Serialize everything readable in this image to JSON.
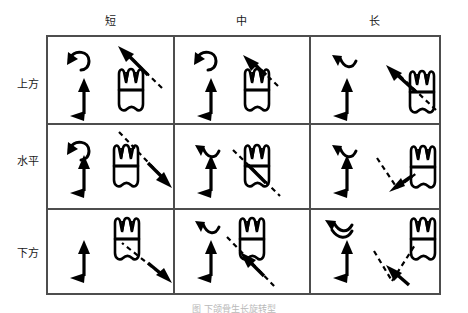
{
  "figure": {
    "title_caption": "图 下颌骨生长旋转型",
    "columns": [
      {
        "id": "short",
        "label": "短"
      },
      {
        "id": "medium",
        "label": "中"
      },
      {
        "id": "long",
        "label": "长"
      }
    ],
    "rows": [
      {
        "id": "above",
        "label": "上方"
      },
      {
        "id": "horizontal",
        "label": "水平"
      },
      {
        "id": "below",
        "label": "下方"
      }
    ],
    "cells": [
      {
        "row": "above",
        "col": "short",
        "curve_icon": "hook-curve-ccw-icon",
        "vertical_arrow_icon": "double-headed-vertical-arrow-icon",
        "tooth_icon": "molar-tooth-icon",
        "dashed_arrow_icon": "dashed-arrow-up-left-icon"
      },
      {
        "row": "above",
        "col": "medium",
        "curve_icon": "hook-curve-ccw-icon",
        "vertical_arrow_icon": "double-headed-vertical-arrow-icon",
        "tooth_icon": "molar-tooth-icon",
        "dashed_arrow_icon": "dashed-arrow-up-left-short-icon"
      },
      {
        "row": "above",
        "col": "long",
        "curve_icon": "shallow-wave-icon",
        "vertical_arrow_icon": "double-headed-vertical-arrow-icon",
        "tooth_icon": "molar-tooth-icon",
        "dashed_arrow_icon": "dashed-arrow-up-left-long-icon"
      },
      {
        "row": "horizontal",
        "col": "short",
        "curve_icon": "hook-curve-ccw-icon",
        "vertical_arrow_icon": "double-headed-vertical-arrow-icon",
        "tooth_icon": "molar-tooth-icon",
        "dashed_arrow_icon": "dashed-arrow-down-right-icon"
      },
      {
        "row": "horizontal",
        "col": "medium",
        "curve_icon": "shallow-wave-icon",
        "vertical_arrow_icon": "double-headed-vertical-arrow-icon",
        "tooth_icon": "molar-tooth-icon",
        "dashed_arrow_icon": "dashed-arrow-through-tooth-icon"
      },
      {
        "row": "horizontal",
        "col": "long",
        "curve_icon": "shallow-wave-icon",
        "vertical_arrow_icon": "double-headed-vertical-arrow-icon",
        "tooth_icon": "molar-tooth-icon",
        "dashed_arrow_icon": "dashed-vee-arrow-left-icon"
      },
      {
        "row": "below",
        "col": "short",
        "curve_icon": "none",
        "vertical_arrow_icon": "double-headed-vertical-arrow-icon",
        "tooth_icon": "molar-tooth-icon",
        "dashed_arrow_icon": "dashed-arrow-up-left-from-lower-right-icon"
      },
      {
        "row": "below",
        "col": "medium",
        "curve_icon": "shallow-wave-icon",
        "vertical_arrow_icon": "double-headed-vertical-arrow-icon",
        "tooth_icon": "molar-tooth-icon",
        "dashed_arrow_icon": "dashed-arrow-up-left-diagonal-icon"
      },
      {
        "row": "below",
        "col": "long",
        "curve_icon": "double-wave-icon",
        "vertical_arrow_icon": "double-headed-vertical-arrow-icon",
        "tooth_icon": "molar-tooth-icon",
        "dashed_arrow_icon": "dashed-vee-arrow-up-right-icon"
      }
    ],
    "colors": {
      "ink": "#000000",
      "grid_line": "#5a5a5a",
      "background": "#ffffff"
    }
  }
}
